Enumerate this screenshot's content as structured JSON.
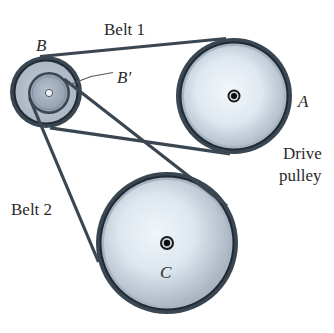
{
  "figure": {
    "type": "belt-pulley-system",
    "labels": {
      "belt1": "Belt 1",
      "belt2": "Belt 2",
      "pulley_b": "B",
      "pulley_b_prime": "B′",
      "pulley_a": "A",
      "drive_line1": "Drive",
      "drive_line2": "pulley",
      "pulley_c": "C"
    },
    "pulleys": [
      {
        "id": "A",
        "role": "drive pulley",
        "cx": 234,
        "cy": 96,
        "r": 57
      },
      {
        "id": "B",
        "role": "outer step pulley",
        "cx": 46,
        "cy": 92,
        "r": 35
      },
      {
        "id": "B'",
        "role": "inner step pulley",
        "cx": 49,
        "cy": 93,
        "r": 20
      },
      {
        "id": "C",
        "role": "driven pulley",
        "cx": 167,
        "cy": 243,
        "r": 70
      }
    ],
    "belts": [
      {
        "id": "Belt 1",
        "connects": [
          "B",
          "A"
        ]
      },
      {
        "id": "Belt 2",
        "connects": [
          "B'",
          "C"
        ]
      }
    ],
    "colors": {
      "belt": "#3a4651",
      "rim": "#9aa6b4",
      "face_center": "#eaf2f8",
      "face_edge": "#b5c0cd",
      "hub": "#111111"
    }
  }
}
